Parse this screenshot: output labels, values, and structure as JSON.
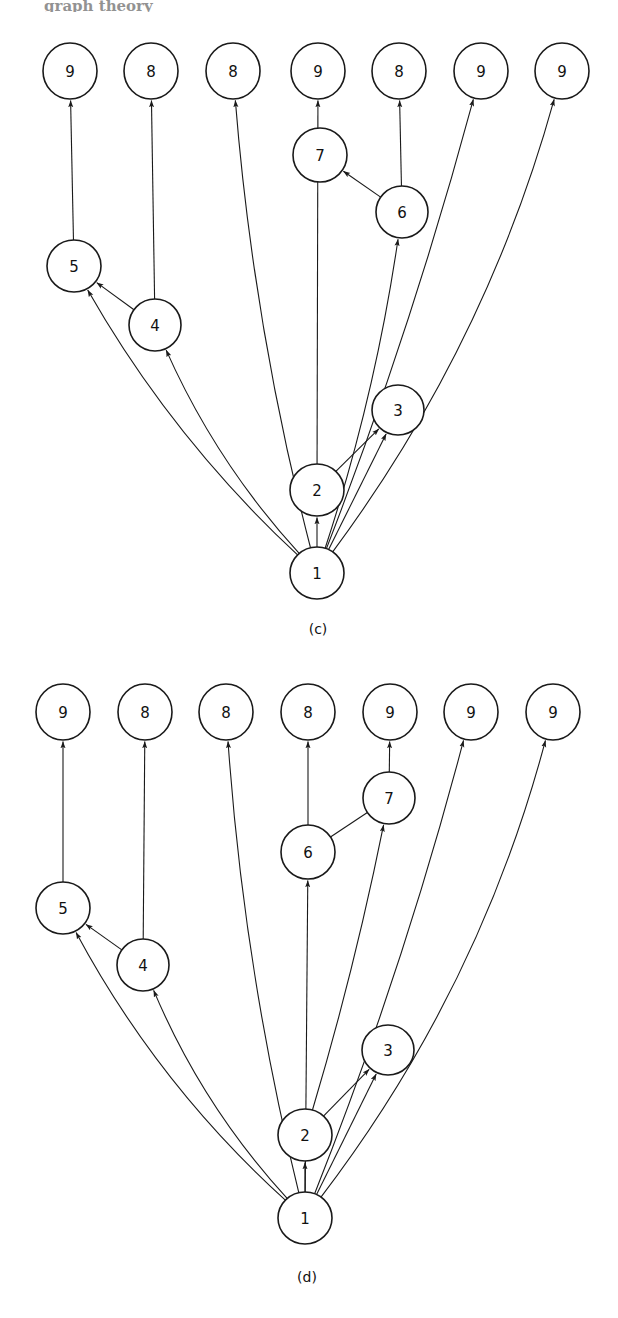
{
  "page": {
    "width": 618,
    "height": 1318,
    "background": "#ffffff",
    "ink_color": "#1a1a1a",
    "cut_off_header_text": "graph theory"
  },
  "panels": [
    {
      "id": "c",
      "caption": "(c)",
      "caption_pos": {
        "x": 318,
        "y": 634
      },
      "nodes": [
        {
          "id": "c1",
          "label": "1",
          "x": 317,
          "y": 573,
          "rx": 27,
          "ry": 26
        },
        {
          "id": "c2",
          "label": "2",
          "x": 317,
          "y": 490,
          "rx": 27,
          "ry": 26
        },
        {
          "id": "c3",
          "label": "3",
          "x": 398,
          "y": 410,
          "rx": 26,
          "ry": 25
        },
        {
          "id": "c4",
          "label": "4",
          "x": 155,
          "y": 325,
          "rx": 26,
          "ry": 26
        },
        {
          "id": "c5",
          "label": "5",
          "x": 74,
          "y": 266,
          "rx": 27,
          "ry": 26
        },
        {
          "id": "c6",
          "label": "6",
          "x": 402,
          "y": 212,
          "rx": 26,
          "ry": 26
        },
        {
          "id": "c7",
          "label": "7",
          "x": 320,
          "y": 155,
          "rx": 27,
          "ry": 27
        },
        {
          "id": "c8",
          "label": "9",
          "x": 70,
          "y": 71,
          "rx": 27,
          "ry": 28
        },
        {
          "id": "c9",
          "label": "8",
          "x": 151,
          "y": 71,
          "rx": 27,
          "ry": 28
        },
        {
          "id": "c10",
          "label": "8",
          "x": 233,
          "y": 71,
          "rx": 27,
          "ry": 28
        },
        {
          "id": "c11",
          "label": "9",
          "x": 318,
          "y": 71,
          "rx": 27,
          "ry": 28
        },
        {
          "id": "c12",
          "label": "8",
          "x": 399,
          "y": 71,
          "rx": 27,
          "ry": 28
        },
        {
          "id": "c13",
          "label": "9",
          "x": 481,
          "y": 71,
          "rx": 27,
          "ry": 28
        },
        {
          "id": "c14",
          "label": "9",
          "x": 562,
          "y": 71,
          "rx": 27,
          "ry": 28
        }
      ],
      "edges": [
        {
          "from": "c1",
          "to": "c2",
          "kind": "straight",
          "arrow": true
        },
        {
          "from": "c1",
          "to": "c3",
          "kind": "straight",
          "arrow": true
        },
        {
          "from": "c2",
          "to": "c3",
          "kind": "straight",
          "arrow": true
        },
        {
          "from": "c4",
          "to": "c5",
          "kind": "straight",
          "arrow": true
        },
        {
          "from": "c6",
          "to": "c7",
          "kind": "straight",
          "arrow": true
        },
        {
          "from": "c1",
          "to": "c5",
          "kind": "curve",
          "arrow": true,
          "bow": -30
        },
        {
          "from": "c1",
          "to": "c4",
          "kind": "curve",
          "arrow": true,
          "bow": -24
        },
        {
          "from": "c1",
          "to": "c6",
          "kind": "curve",
          "arrow": true,
          "bow": 16
        },
        {
          "from": "c5",
          "to": "c8",
          "kind": "straight",
          "arrow": true
        },
        {
          "from": "c4",
          "to": "c9",
          "kind": "straight",
          "arrow": true
        },
        {
          "from": "c1",
          "to": "c10",
          "kind": "curve",
          "arrow": true,
          "bow": -22
        },
        {
          "from": "c2",
          "to": "c11",
          "kind": "straight",
          "arrow": true
        },
        {
          "from": "c6",
          "to": "c12",
          "kind": "straight",
          "arrow": true
        },
        {
          "from": "c1",
          "to": "c13",
          "kind": "curve",
          "arrow": true,
          "bow": 14
        },
        {
          "from": "c1",
          "to": "c14",
          "kind": "curve",
          "arrow": true,
          "bow": 52
        }
      ]
    },
    {
      "id": "d",
      "caption": "(d)",
      "caption_pos": {
        "x": 307,
        "y": 1282
      },
      "nodes": [
        {
          "id": "d1",
          "label": "1",
          "x": 305,
          "y": 1218,
          "rx": 27,
          "ry": 26
        },
        {
          "id": "d2",
          "label": "2",
          "x": 305,
          "y": 1135,
          "rx": 27,
          "ry": 26
        },
        {
          "id": "d3",
          "label": "3",
          "x": 388,
          "y": 1050,
          "rx": 26,
          "ry": 25
        },
        {
          "id": "d4",
          "label": "4",
          "x": 143,
          "y": 965,
          "rx": 26,
          "ry": 26
        },
        {
          "id": "d5",
          "label": "5",
          "x": 63,
          "y": 908,
          "rx": 27,
          "ry": 26
        },
        {
          "id": "d6",
          "label": "6",
          "x": 308,
          "y": 852,
          "rx": 27,
          "ry": 27
        },
        {
          "id": "d7",
          "label": "7",
          "x": 389,
          "y": 798,
          "rx": 26,
          "ry": 26
        },
        {
          "id": "d8",
          "label": "9",
          "x": 63,
          "y": 712,
          "rx": 27,
          "ry": 28
        },
        {
          "id": "d9",
          "label": "8",
          "x": 145,
          "y": 712,
          "rx": 27,
          "ry": 28
        },
        {
          "id": "d10",
          "label": "8",
          "x": 226,
          "y": 712,
          "rx": 27,
          "ry": 28
        },
        {
          "id": "d11",
          "label": "8",
          "x": 308,
          "y": 712,
          "rx": 27,
          "ry": 28
        },
        {
          "id": "d12",
          "label": "9",
          "x": 390,
          "y": 712,
          "rx": 27,
          "ry": 28
        },
        {
          "id": "d13",
          "label": "9",
          "x": 471,
          "y": 712,
          "rx": 27,
          "ry": 28
        },
        {
          "id": "d14",
          "label": "9",
          "x": 553,
          "y": 712,
          "rx": 27,
          "ry": 28
        }
      ],
      "edges": [
        {
          "from": "d1",
          "to": "d2",
          "kind": "straight",
          "arrow": true
        },
        {
          "from": "d1",
          "to": "d3",
          "kind": "straight",
          "arrow": true
        },
        {
          "from": "d2",
          "to": "d3",
          "kind": "straight",
          "arrow": true
        },
        {
          "from": "d4",
          "to": "d5",
          "kind": "straight",
          "arrow": true
        },
        {
          "from": "d6",
          "to": "d7",
          "kind": "straight",
          "arrow": false
        },
        {
          "from": "d1",
          "to": "d5",
          "kind": "curve",
          "arrow": true,
          "bow": -34
        },
        {
          "from": "d1",
          "to": "d4",
          "kind": "curve",
          "arrow": true,
          "bow": -26
        },
        {
          "from": "d2",
          "to": "d7",
          "kind": "curve",
          "arrow": true,
          "bow": 8
        },
        {
          "from": "d5",
          "to": "d8",
          "kind": "straight",
          "arrow": true
        },
        {
          "from": "d4",
          "to": "d9",
          "kind": "straight",
          "arrow": true
        },
        {
          "from": "d1",
          "to": "d10",
          "kind": "curve",
          "arrow": true,
          "bow": -22
        },
        {
          "from": "d6",
          "to": "d11",
          "kind": "straight",
          "arrow": true
        },
        {
          "from": "d1",
          "to": "d6",
          "kind": "straight",
          "arrow": true
        },
        {
          "from": "d7",
          "to": "d12",
          "kind": "straight",
          "arrow": true
        },
        {
          "from": "d1",
          "to": "d13",
          "kind": "curve",
          "arrow": true,
          "bow": 16
        },
        {
          "from": "d1",
          "to": "d14",
          "kind": "curve",
          "arrow": true,
          "bow": 56
        }
      ]
    }
  ]
}
